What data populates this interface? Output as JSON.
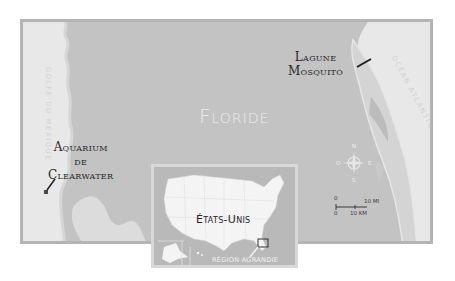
{
  "map": {
    "title": "Floride",
    "labels": {
      "lagoon_line1": "Lagune",
      "lagoon_line2": "Mosquito",
      "aquarium_line1": "Aquarium",
      "aquarium_line2": "de",
      "aquarium_line3": "Clearwater"
    },
    "water_bodies": {
      "gulf": "Golfe du Mexique",
      "ocean": "Océan Atlantique"
    },
    "compass": {
      "n": "N",
      "s": "S",
      "e": "E",
      "w": "O"
    },
    "scale": {
      "mi_zero": "0",
      "mi_label": "10 MI",
      "km_zero": "0",
      "km_label": "10 KM"
    },
    "inset": {
      "country_label": "États-Unis",
      "caption": "Région agrandie"
    },
    "colors": {
      "land": "#c3c3c3",
      "water": "#e6e6e6",
      "frame": "#b4b4b4",
      "text_dark": "#262626",
      "title": "#ececec"
    }
  }
}
